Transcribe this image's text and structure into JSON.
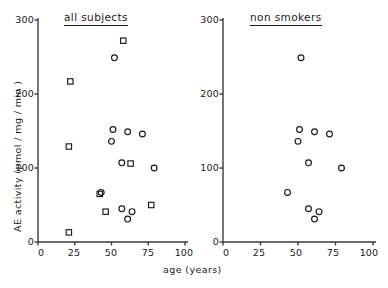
{
  "figure": {
    "axis_color": "#3a3a3a",
    "marker_color": "#1a1a1a",
    "xlabel": "age  (years)",
    "ylabel": "AE  activity  (pmol / mg / min )"
  },
  "chart_data": [
    {
      "type": "scatter",
      "title": "all subjects",
      "xlabel": "age  (years)",
      "ylabel": "AE  activity  (pmol / mg / min )",
      "xlim": [
        0,
        100
      ],
      "ylim": [
        0,
        300
      ],
      "xticks": [
        0,
        25,
        50,
        75,
        100
      ],
      "yticks": [
        0,
        100,
        200,
        300
      ],
      "grid": false,
      "legend": "none",
      "series": [
        {
          "name": "smokers",
          "marker": "square",
          "points": [
            {
              "x": 58,
              "y": 272
            },
            {
              "x": 22,
              "y": 217
            },
            {
              "x": 21,
              "y": 129
            },
            {
              "x": 63,
              "y": 106
            },
            {
              "x": 42,
              "y": 65
            },
            {
              "x": 77,
              "y": 50
            },
            {
              "x": 46,
              "y": 41
            },
            {
              "x": 21,
              "y": 13
            }
          ]
        },
        {
          "name": "non smokers",
          "marker": "circle",
          "points": [
            {
              "x": 52,
              "y": 249
            },
            {
              "x": 51,
              "y": 152
            },
            {
              "x": 61,
              "y": 149
            },
            {
              "x": 71,
              "y": 146
            },
            {
              "x": 50,
              "y": 136
            },
            {
              "x": 57,
              "y": 107
            },
            {
              "x": 79,
              "y": 100
            },
            {
              "x": 43,
              "y": 67
            },
            {
              "x": 57,
              "y": 45
            },
            {
              "x": 64,
              "y": 41
            },
            {
              "x": 61,
              "y": 31
            }
          ]
        }
      ]
    },
    {
      "type": "scatter",
      "title": "non smokers",
      "xlabel": "age  (years)",
      "ylabel": "",
      "xlim": [
        0,
        100
      ],
      "ylim": [
        0,
        300
      ],
      "xticks": [
        0,
        25,
        50,
        75,
        100
      ],
      "yticks": [
        0,
        100,
        200,
        300
      ],
      "grid": false,
      "legend": "none",
      "series": [
        {
          "name": "non smokers",
          "marker": "circle",
          "points": [
            {
              "x": 52,
              "y": 249
            },
            {
              "x": 51,
              "y": 152
            },
            {
              "x": 61,
              "y": 149
            },
            {
              "x": 71,
              "y": 146
            },
            {
              "x": 50,
              "y": 136
            },
            {
              "x": 57,
              "y": 107
            },
            {
              "x": 79,
              "y": 100
            },
            {
              "x": 43,
              "y": 67
            },
            {
              "x": 57,
              "y": 45
            },
            {
              "x": 64,
              "y": 41
            },
            {
              "x": 61,
              "y": 31
            }
          ]
        }
      ]
    }
  ],
  "panels": [
    {
      "title": "all subjects",
      "yticklabels": [
        "300",
        "200",
        "100",
        "0"
      ],
      "xticklabels": [
        "0",
        "25",
        "50",
        "75",
        "100"
      ]
    },
    {
      "title": "non smokers",
      "yticklabels": [
        "300",
        "200",
        "100",
        "0"
      ],
      "xticklabels": [
        "0",
        "25",
        "50",
        "75",
        "100"
      ]
    }
  ]
}
